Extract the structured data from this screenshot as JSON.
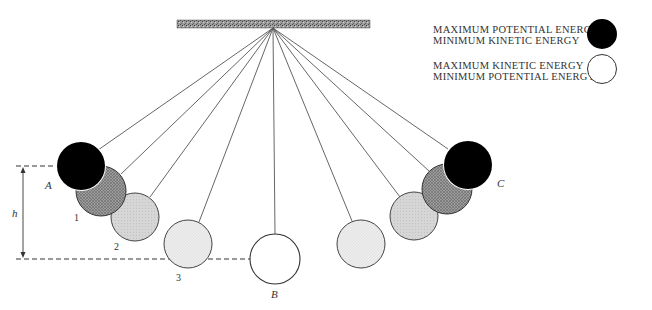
{
  "diagram": {
    "ceiling": {
      "x": 177,
      "y": 20,
      "width": 193,
      "height": 8,
      "pivot": [
        273,
        28
      ]
    },
    "positions": [
      {
        "id": "A",
        "label": "A",
        "cx": 81,
        "cy": 166,
        "r": 24,
        "fill": "#000000",
        "state": "max-potential"
      },
      {
        "id": "1",
        "label": "1",
        "cx": 101,
        "cy": 191,
        "r": 25,
        "fill": "#8a8a8a",
        "state": "intermediate"
      },
      {
        "id": "2",
        "label": "2",
        "cx": 135,
        "cy": 217,
        "r": 24,
        "fill": "#cfcfcf",
        "state": "intermediate"
      },
      {
        "id": "3",
        "label": "3",
        "cx": 188,
        "cy": 244,
        "r": 24,
        "fill": "#ebebeb",
        "state": "intermediate"
      },
      {
        "id": "B",
        "label": "B",
        "cx": 275,
        "cy": 259,
        "r": 25,
        "fill": "#ffffff",
        "state": "max-kinetic"
      },
      {
        "id": "3r",
        "label": "",
        "cx": 361,
        "cy": 244,
        "r": 24,
        "fill": "#ebebeb",
        "state": "intermediate"
      },
      {
        "id": "2r",
        "label": "",
        "cx": 414,
        "cy": 216,
        "r": 24,
        "fill": "#cfcfcf",
        "state": "intermediate"
      },
      {
        "id": "1r",
        "label": "",
        "cx": 447,
        "cy": 189,
        "r": 25,
        "fill": "#8a8a8a",
        "state": "intermediate"
      },
      {
        "id": "C",
        "label": "C",
        "cx": 468,
        "cy": 165,
        "r": 24,
        "fill": "#000000",
        "state": "max-potential"
      }
    ],
    "labels": {
      "A": "A",
      "B": "B",
      "C": "C",
      "one": "1",
      "two": "2",
      "three": "3",
      "height": "h"
    },
    "height_marker": {
      "x": 23,
      "top_y": 166,
      "bottom_y": 259
    }
  },
  "legend": {
    "items": [
      {
        "line1": "MAXIMUM POTENTIAL ENERGY",
        "line2": "MINIMUM KINETIC ENERGY",
        "swatch": "#000000"
      },
      {
        "line1": "MAXIMUM KINETIC ENERGY",
        "line2": "MINIMUM POTENTIAL ENERGY",
        "swatch": "#ffffff"
      }
    ]
  }
}
